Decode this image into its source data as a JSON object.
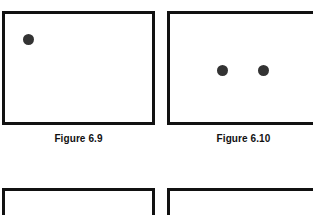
{
  "page": {
    "background_color": "#ffffff",
    "width": 313,
    "height": 215,
    "border_color": "#111111",
    "dot_color": "#333333",
    "caption_color": "#111111"
  },
  "figures": [
    {
      "id": "6.9",
      "caption": "Figure 6.9",
      "dot_count": "1",
      "dots": [
        {
          "name": "dot-1",
          "left": 18,
          "top": 20,
          "size": 11
        }
      ]
    },
    {
      "id": "6.10",
      "caption": "Figure 6.10",
      "dot_count": "2",
      "dots": [
        {
          "name": "dot-1",
          "left": 47,
          "top": 51,
          "size": 11
        },
        {
          "name": "dot-2",
          "left": 88,
          "top": 51,
          "size": 11
        }
      ]
    },
    {
      "id": "next-left",
      "caption": "",
      "dot_count": "0",
      "dots": []
    },
    {
      "id": "next-right",
      "caption": "",
      "dot_count": "0",
      "dots": []
    }
  ]
}
